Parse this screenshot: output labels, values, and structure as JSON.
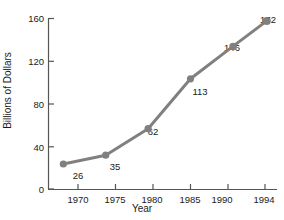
{
  "chart_data": {
    "type": "line",
    "title": "",
    "xlabel": "Year",
    "ylabel": "Billions of Dollars",
    "categories": [
      "1970",
      "1975",
      "1980",
      "1985",
      "1990",
      "1994"
    ],
    "x": [
      1970,
      1975,
      1980,
      1985,
      1990,
      1994
    ],
    "values": [
      26,
      35,
      62,
      113,
      146,
      172
    ],
    "point_labels": [
      "26",
      "35",
      "62",
      "113",
      "146",
      "172"
    ],
    "xlim": [
      1968.2,
      1995.2
    ],
    "ylim": [
      0,
      175
    ],
    "y_ticks": [
      0,
      40,
      80,
      120,
      160
    ],
    "y_tick_labels": [
      "0",
      "40",
      "80",
      "120",
      "160"
    ],
    "x_ticks": [
      1970,
      1975,
      1980,
      1985,
      1990,
      1994
    ],
    "grid": false,
    "legend": null,
    "legend_position": "none",
    "series_color": "#808080",
    "axis_color": "#555555",
    "text_color": "#1a1a1a",
    "marker": "circle",
    "marker_size": 5,
    "line_width": 3
  },
  "axes": {
    "y_title": "Billions of Dollars",
    "x_title": "Year"
  }
}
